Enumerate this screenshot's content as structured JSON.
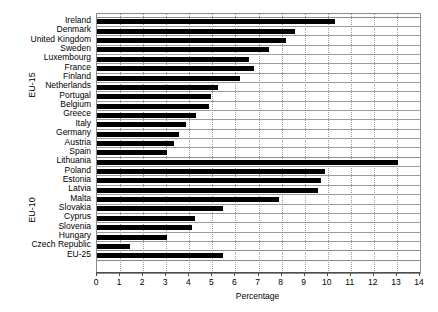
{
  "chart_data": {
    "type": "bar",
    "orientation": "horizontal",
    "title": "",
    "subtitle": "",
    "xlabel": "Percentage",
    "ylabel": "",
    "xlim": [
      0,
      14
    ],
    "xticks": [
      0,
      1,
      2,
      3,
      4,
      5,
      6,
      7,
      8,
      9,
      10,
      11,
      12,
      13,
      14
    ],
    "xtick_labels": [
      "0",
      "1",
      "2",
      "3",
      "4",
      "5",
      "6",
      "7",
      "8",
      "9",
      "10",
      "11",
      "12",
      "13",
      "14"
    ],
    "grid": "vertical-dotted",
    "legend": "none",
    "bar_color": "#000000",
    "categories": [
      "Ireland",
      "Denmark",
      "United Kingdom",
      "Sweden",
      "Luxembourg",
      "France",
      "Finland",
      "Netherlands",
      "Portugal",
      "Belgium",
      "Greece",
      "Italy",
      "Germany",
      "Austria",
      "Spain",
      "Lithuania",
      "Poland",
      "Estonia",
      "Latvia",
      "Malta",
      "Slovakia",
      "Cyprus",
      "Slovenia",
      "Hungary",
      "Czech Republic",
      "EU-25"
    ],
    "values": [
      10.3,
      8.6,
      8.2,
      7.45,
      6.6,
      6.8,
      6.2,
      5.25,
      4.95,
      4.85,
      4.3,
      3.85,
      3.55,
      3.35,
      3.05,
      13.05,
      9.9,
      9.7,
      9.6,
      7.9,
      5.45,
      4.25,
      4.1,
      3.05,
      1.45,
      5.45
    ],
    "groups": [
      {
        "label": "EU-15",
        "start_index": 0,
        "end_index": 14
      },
      {
        "label": "EU-10",
        "start_index": 15,
        "end_index": 24
      },
      {
        "label": "",
        "start_index": 25,
        "end_index": 25
      }
    ]
  },
  "axis": {
    "x_title": "Percentage",
    "group_labels": [
      "EU-15",
      "EU-10"
    ]
  }
}
